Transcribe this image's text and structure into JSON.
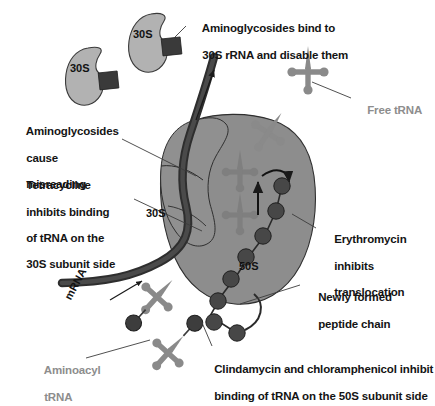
{
  "figure": {
    "background_color": "#ffffff"
  },
  "colors": {
    "ribosome_body": "#8d8d8d",
    "subunit_30s_free": "#b2b2b2",
    "trna": "#8a8a8a",
    "peptide_bead": "#474747",
    "mrna": "#333333",
    "aminoglycoside_block": "#3a3a3a",
    "text_dark": "#1c1c1c",
    "text_gray": "#8d8d8d",
    "leader_line": "#3c3c3c"
  },
  "labels": {
    "aminoglycosides_bind": {
      "line1": "Aminoglycosides bind to",
      "line2": "30S rRNA and disable them",
      "style": "dark"
    },
    "free_trna": {
      "line1": "Free tRNA",
      "style": "gray"
    },
    "aminoglycosides_misreading": {
      "line1": "Aminoglycosides",
      "line2": "cause",
      "line3": "misreading",
      "style": "dark"
    },
    "tetracycline": {
      "line1": "Tetracycline",
      "line2": "inhibits binding",
      "line3": "of tRNA on the",
      "line4": "30S subunit side",
      "style": "dark"
    },
    "erythromycin": {
      "line1": "Erythromycin",
      "line2": "inhibits",
      "line3": "translocation",
      "style": "dark"
    },
    "newly_formed_peptide": {
      "line1": "Newly formed",
      "line2": "peptide chain",
      "style": "dark"
    },
    "clindamycin": {
      "line1": "Clindamycin and chloramphenicol inhibit",
      "line2": "binding of tRNA on the 50S subunit side",
      "style": "dark"
    },
    "aminoacyl_trna": {
      "line1": "Aminoacyl",
      "line2": "tRNA",
      "style": "gray"
    }
  },
  "inline_labels": {
    "subunit_30s_free_a": "30S",
    "subunit_30s_free_b": "30S",
    "subunit_30s_ribosome": "30S",
    "subunit_50s_ribosome": "50S",
    "mrna": "mRNA"
  },
  "structures": {
    "free_30s_subunits": 2,
    "aminoglycoside_blocks": 2,
    "free_trna_count": 1,
    "aminoacyl_trna_count": 2,
    "bound_trna_count": 3,
    "peptide_chain_beads": 8,
    "translocation_arrows": 2,
    "mrna_direction_arrow": 1
  }
}
